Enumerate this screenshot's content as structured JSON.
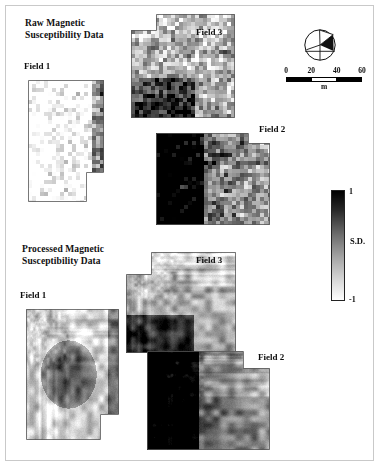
{
  "figure": {
    "background": "#ffffff",
    "frame_color": "#c9c9c9"
  },
  "panels": [
    {
      "id": "raw",
      "title": "Raw Magnetic\nSusceptibility Data",
      "rendering": "blocky",
      "fields": [
        {
          "name": "Field 1",
          "label_x": 24,
          "label_y": 65
        },
        {
          "name": "Field 3",
          "label_x": 196,
          "label_y": 28
        },
        {
          "name": "Field 2",
          "label_x": 259,
          "label_y": 126
        }
      ]
    },
    {
      "id": "processed",
      "title": "Processed Magnetic\nSusceptibility Data",
      "rendering": "smooth",
      "fields": [
        {
          "name": "Field 1",
          "label_x": 20,
          "label_y": 293
        },
        {
          "name": "Field 3",
          "label_x": 196,
          "label_y": 257
        },
        {
          "name": "Field 2",
          "label_x": 258,
          "label_y": 354
        }
      ]
    }
  ],
  "north_arrow": {
    "icon": "north-arrow-compass-icon",
    "label": ""
  },
  "scale_bar": {
    "ticks": [
      "0",
      "20",
      "40",
      "60"
    ],
    "unit": "m",
    "segments": [
      "on",
      "off",
      "on"
    ],
    "max_value": 60
  },
  "colorbar": {
    "max_label": "1",
    "min_label": "-1",
    "unit_label": "S.D.",
    "max_color": "#000000",
    "min_color": "#ffffff"
  },
  "chart_data": {
    "type": "heatmap",
    "colormap": "grayscale_inverted",
    "value_label": "S.D.",
    "vmin": -1,
    "vmax": 1,
    "legend_position": "right",
    "grid": false,
    "scale_bar_m": [
      0,
      20,
      40,
      60
    ],
    "panels": [
      {
        "name": "Raw Magnetic Susceptibility Data",
        "cell_px": 4.2,
        "fields": [
          {
            "name": "Field 1",
            "x": 28,
            "y": 80,
            "w": 76,
            "h": 122,
            "notch": {
              "x": 86,
              "y": 172,
              "w": 18,
              "h": 30
            },
            "mean": 0.72,
            "contrast": 0.62,
            "seed": 1171,
            "dark_edge": "right"
          },
          {
            "name": "Field 3",
            "x": 131,
            "y": 14,
            "w": 104,
            "h": 104,
            "notch": {
              "x": 131,
              "y": 14,
              "w": 25,
              "h": 16
            },
            "mean": 0.18,
            "contrast": 0.7,
            "seed": 3313,
            "dark_edge": "bottom-left"
          },
          {
            "name": "Field 2",
            "x": 156,
            "y": 133,
            "w": 114,
            "h": 92,
            "notch": {
              "x": 248,
              "y": 133,
              "w": 22,
              "h": 10
            },
            "mean": -0.3,
            "contrast": 0.8,
            "seed": 2212,
            "dark_edge": "left"
          }
        ]
      },
      {
        "name": "Processed Magnetic Susceptibility Data",
        "cell_px": 1,
        "fields": [
          {
            "name": "Field 1",
            "x": 26,
            "y": 309,
            "w": 93,
            "h": 131,
            "notch": {
              "x": 100,
              "y": 414,
              "w": 19,
              "h": 26
            },
            "mean": 0.34,
            "contrast": 0.74,
            "seed": 5171,
            "dark_edge": "center"
          },
          {
            "name": "Field 3",
            "x": 126,
            "y": 252,
            "w": 110,
            "h": 101,
            "notch": {
              "x": 126,
              "y": 252,
              "w": 25,
              "h": 22
            },
            "mean": 0.22,
            "contrast": 0.76,
            "seed": 7313,
            "dark_edge": "bottom-left"
          },
          {
            "name": "Field 2",
            "x": 147,
            "y": 351,
            "w": 123,
            "h": 99,
            "notch": {
              "x": 243,
              "y": 351,
              "w": 27,
              "h": 17
            },
            "mean": -0.22,
            "contrast": 0.82,
            "seed": 6212,
            "dark_edge": "left"
          }
        ]
      }
    ]
  }
}
